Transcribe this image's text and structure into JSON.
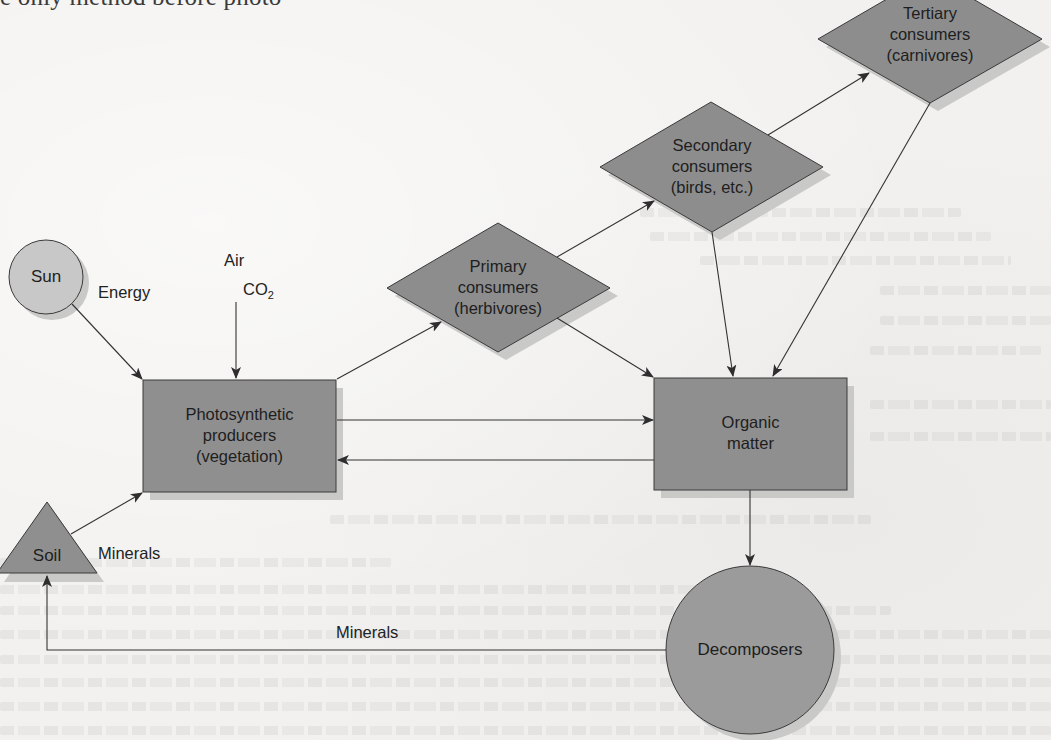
{
  "page": {
    "header_fragment": "e only method before photo-"
  },
  "colors": {
    "page_bg": "#f2f1ef",
    "node_fill": "#8f8f8f",
    "sun_fill": "#c8c8c8",
    "decomposer_fill": "#9b9b9b",
    "shadow": "#c9c9c7",
    "stroke": "#3a3a3a",
    "arrow": "#333333"
  },
  "diagram": {
    "nodes": {
      "sun": {
        "label": "Sun",
        "shape": "circle"
      },
      "soil": {
        "label": "Soil",
        "shape": "triangle"
      },
      "producers": {
        "shape": "rectangle",
        "lines": [
          "Photosynthetic",
          "producers",
          "(vegetation)"
        ]
      },
      "primary": {
        "shape": "diamond",
        "lines": [
          "Primary",
          "consumers",
          "(herbivores)"
        ]
      },
      "secondary": {
        "shape": "diamond",
        "lines": [
          "Secondary",
          "consumers",
          "(birds, etc.)"
        ]
      },
      "tertiary": {
        "shape": "diamond",
        "lines": [
          "Tertiary",
          "consumers",
          "(carnivores)"
        ]
      },
      "organic": {
        "shape": "rectangle",
        "lines": [
          "Organic",
          "matter"
        ]
      },
      "decomposers": {
        "label": "Decomposers",
        "shape": "circle"
      }
    },
    "edge_labels": {
      "energy": "Energy",
      "air": "Air",
      "co2_main": "CO",
      "co2_sub": "2",
      "minerals_soil": "Minerals",
      "minerals_return": "Minerals"
    },
    "edges": [
      {
        "from": "Sun",
        "to": "Photosynthetic producers",
        "label": "Energy"
      },
      {
        "from": "Air",
        "to": "Photosynthetic producers",
        "label": "CO2"
      },
      {
        "from": "Soil",
        "to": "Photosynthetic producers",
        "label": "Minerals"
      },
      {
        "from": "Photosynthetic producers",
        "to": "Primary consumers"
      },
      {
        "from": "Photosynthetic producers",
        "to": "Organic matter"
      },
      {
        "from": "Organic matter",
        "to": "Photosynthetic producers"
      },
      {
        "from": "Primary consumers",
        "to": "Secondary consumers"
      },
      {
        "from": "Primary consumers",
        "to": "Organic matter"
      },
      {
        "from": "Secondary consumers",
        "to": "Tertiary consumers"
      },
      {
        "from": "Secondary consumers",
        "to": "Organic matter"
      },
      {
        "from": "Tertiary consumers",
        "to": "Organic matter"
      },
      {
        "from": "Organic matter",
        "to": "Decomposers"
      },
      {
        "from": "Decomposers",
        "to": "Soil",
        "label": "Minerals"
      }
    ]
  }
}
